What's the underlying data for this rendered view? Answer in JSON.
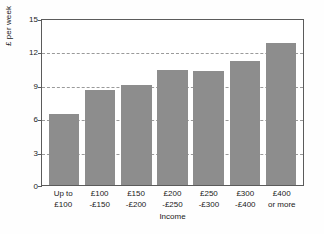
{
  "chart_data": {
    "type": "bar",
    "title": "",
    "xlabel": "Income",
    "ylabel": "£ per week",
    "categories": [
      "Up to £100",
      "£100 -£150",
      "£150 -£200",
      "£200 -£250",
      "£250 -£300",
      "£300 -£400",
      "£400 or more"
    ],
    "category_lines": [
      [
        "Up to",
        "£100"
      ],
      [
        "£100",
        "-£150"
      ],
      [
        "£150",
        "-£200"
      ],
      [
        "£200",
        "-£250"
      ],
      [
        "£250",
        "-£300"
      ],
      [
        "£300",
        "-£400"
      ],
      [
        "£400",
        "or more"
      ]
    ],
    "values": [
      6.4,
      8.5,
      9.0,
      10.3,
      10.2,
      11.1,
      12.8
    ],
    "ylim": [
      0,
      15
    ],
    "yticks": [
      0,
      3,
      6,
      9,
      12,
      15
    ],
    "ytick_labels": [
      "0",
      "3",
      "6",
      "9",
      "12",
      "15"
    ],
    "grid": true,
    "grid_style": "dashed",
    "legend": "none",
    "bar_color": "#8d8d8d",
    "grid_color": "#9a9a9a",
    "axis_color": "#5b5b5b",
    "text_color": "#1a1a1a",
    "background_color": "#ffffff"
  }
}
